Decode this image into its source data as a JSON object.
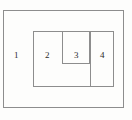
{
  "diagram": {
    "type": "nested-rectangles",
    "canvas": {
      "width": 132,
      "height": 120,
      "background_color": "#fdfdfc"
    },
    "stroke_color": "#8d8d8d",
    "label_color": "#2b2b2b",
    "regions": [
      {
        "id": "1",
        "label": "1",
        "x": 3,
        "y": 10,
        "width": 121,
        "height": 98,
        "label_x": 14,
        "label_y": 51,
        "description": "outermost rectangle"
      },
      {
        "id": "2",
        "label": "2",
        "x": 33,
        "y": 31,
        "width": 81,
        "height": 56,
        "label_x": 45,
        "label_y": 51,
        "description": "middle rectangle nested inside region 1"
      },
      {
        "id": "3",
        "label": "3",
        "x": 62,
        "y": 31,
        "width": 28,
        "height": 33,
        "label_x": 74,
        "label_y": 51,
        "description": "small upper rectangle nested inside region 2"
      },
      {
        "id": "4",
        "label": "4",
        "x": 90,
        "y": 31,
        "width": 24,
        "height": 56,
        "label_x": 100,
        "label_y": 51,
        "description": "right-hand column rectangle inside region 2"
      }
    ]
  }
}
